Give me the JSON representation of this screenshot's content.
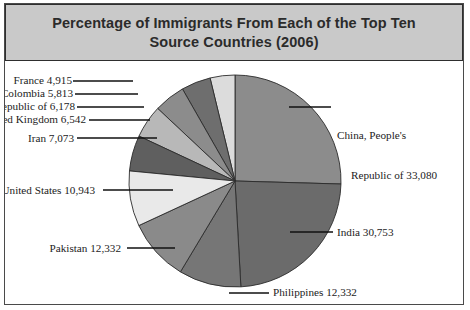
{
  "figure": {
    "title": "Percentage of Immigrants From Each of the Top Ten Source Countries (2006)",
    "title_line1": "Percentage of Immigrants From Each of the Top Ten Source",
    "title_line2": "Countries (2006)",
    "frame_color": "#4a4a4a",
    "title_band_color": "#c9c9c9",
    "background_color": "#ffffff"
  },
  "labels": {
    "china_line1": "China, People's",
    "china_line2": "Republic of 33,080",
    "india": "India 30,753",
    "philippines": "Philippines 12,332",
    "pakistan": "Pakistan 12,332",
    "united_states": "United States 10,943",
    "iran": "Iran 7,073",
    "united_kingdom": "United Kingdom 6,542",
    "korea": "Korea, Republic of 6,178",
    "colombia": "Colombia 5,813",
    "france": "France 4,915"
  },
  "chart_data": {
    "type": "pie",
    "title": "Percentage of Immigrants From Each of the Top Ten Source Countries (2006)",
    "total": 129961,
    "legend_position": "none",
    "value_format": "comma-separated integers shown in leader labels",
    "categories": [
      "China, People's Republic of",
      "India",
      "Philippines",
      "Pakistan",
      "United States",
      "Iran",
      "United Kingdom",
      "Korea, Republic of",
      "Colombia",
      "France"
    ],
    "values": [
      33080,
      30753,
      12332,
      12332,
      10943,
      7073,
      6542,
      6178,
      5813,
      4915
    ],
    "slices": [
      {
        "name": "China, People's Republic of",
        "label": "China, People's Republic of 33,080",
        "value": 33080,
        "percent": 25.5,
        "color": "#8c8c8c"
      },
      {
        "name": "India",
        "label": "India 30,753",
        "value": 30753,
        "percent": 23.7,
        "color": "#6b6b6b"
      },
      {
        "name": "Philippines",
        "label": "Philippines 12,332",
        "value": 12332,
        "percent": 9.5,
        "color": "#767676"
      },
      {
        "name": "Pakistan",
        "label": "Pakistan 12,332",
        "value": 12332,
        "percent": 9.5,
        "color": "#8a8a8a"
      },
      {
        "name": "United States",
        "label": "United States 10,943",
        "value": 10943,
        "percent": 8.4,
        "color": "#e9e9e9"
      },
      {
        "name": "Iran",
        "label": "Iran 7,073",
        "value": 7073,
        "percent": 5.4,
        "color": "#5f5f5f"
      },
      {
        "name": "United Kingdom",
        "label": "United Kingdom 6,542",
        "value": 6542,
        "percent": 5.0,
        "color": "#b8b8b8"
      },
      {
        "name": "Korea, Republic of",
        "label": "Korea, Republic of 6,178",
        "value": 6178,
        "percent": 4.8,
        "color": "#8c8c8c"
      },
      {
        "name": "Colombia",
        "label": "Colombia 5,813",
        "value": 5813,
        "percent": 4.5,
        "color": "#6e6e6e"
      },
      {
        "name": "France",
        "label": "France 4,915",
        "value": 4915,
        "percent": 3.8,
        "color": "#dcdcdc"
      }
    ]
  }
}
